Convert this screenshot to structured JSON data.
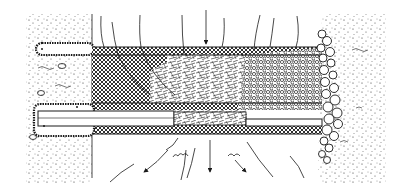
{
  "figure": {
    "type": "cross-section illustration",
    "style": "black ink line art on white",
    "colors": {
      "ink": "#1a1a1a",
      "background": "#ffffff"
    },
    "regions": [
      {
        "id": "left-soil",
        "label": ""
      },
      {
        "id": "upper-anchor",
        "label": ""
      },
      {
        "id": "lower-anchor-pipe",
        "label": ""
      },
      {
        "id": "crosshatch-fill",
        "label": ""
      },
      {
        "id": "fibrous-fill",
        "label": ""
      },
      {
        "id": "gravel-fill",
        "label": ""
      },
      {
        "id": "boulder-edge",
        "label": ""
      },
      {
        "id": "right-soil",
        "label": ""
      },
      {
        "id": "flow-lines-top",
        "label": ""
      },
      {
        "id": "flow-arrows-bottom",
        "label": ""
      }
    ]
  }
}
